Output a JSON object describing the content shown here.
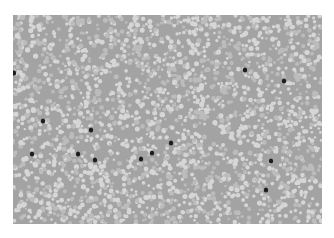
{
  "image": {
    "description": "Grayscale light-microscopy field of densely packed red blood cells with scattered dark-stained cells",
    "frame": {
      "x": 13,
      "y": 15,
      "width": 309,
      "height": 209
    },
    "colors": {
      "background": "#ffffff",
      "field": "#a3a3a3",
      "cell_light": "#d6d6d6",
      "cell_mid": "#bcbcbc",
      "dark_cell": "#1e1e1e"
    },
    "dark_cells": [
      {
        "x": 14,
        "y": 73
      },
      {
        "x": 43,
        "y": 121
      },
      {
        "x": 32,
        "y": 154
      },
      {
        "x": 78,
        "y": 154
      },
      {
        "x": 91,
        "y": 130
      },
      {
        "x": 95,
        "y": 160
      },
      {
        "x": 141,
        "y": 159
      },
      {
        "x": 152,
        "y": 153
      },
      {
        "x": 171,
        "y": 143
      },
      {
        "x": 245,
        "y": 70
      },
      {
        "x": 284,
        "y": 81
      },
      {
        "x": 271,
        "y": 161
      },
      {
        "x": 266,
        "y": 190
      }
    ]
  }
}
